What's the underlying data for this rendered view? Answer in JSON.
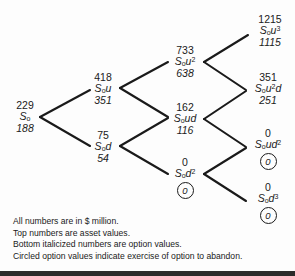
{
  "diagram": {
    "line_color": "#1a1a1a",
    "text_color": "#1a1a1a",
    "nodes": [
      {
        "id": "root",
        "asset": "229",
        "label_base": "S",
        "label_sub": "o",
        "label_sup": "",
        "label_tail": "",
        "option": "188",
        "circled": false
      },
      {
        "id": "u",
        "asset": "418",
        "label_base": "S",
        "label_sub": "o",
        "label_sup": "",
        "label_tail": "u",
        "option": "351",
        "circled": false
      },
      {
        "id": "d",
        "asset": "75",
        "label_base": "S",
        "label_sub": "o",
        "label_sup": "",
        "label_tail": "d",
        "option": "54",
        "circled": false
      },
      {
        "id": "uu",
        "asset": "733",
        "label_base": "S",
        "label_sub": "o",
        "label_sup": "2",
        "label_tail": "u",
        "option": "638",
        "circled": false
      },
      {
        "id": "ud",
        "asset": "162",
        "label_base": "S",
        "label_sub": "o",
        "label_sup": "",
        "label_tail": "ud",
        "option": "116",
        "circled": false
      },
      {
        "id": "dd",
        "asset": "0",
        "label_base": "S",
        "label_sub": "o",
        "label_sup": "2",
        "label_tail": "d",
        "option": "0",
        "circled": true
      },
      {
        "id": "uuu",
        "asset": "1215",
        "label_base": "S",
        "label_sub": "o",
        "label_sup": "3",
        "label_tail": "u",
        "option": "1115",
        "circled": false
      },
      {
        "id": "uud",
        "asset": "351",
        "label_base": "S",
        "label_sub": "o",
        "label_sup": "2",
        "label_tail": "u",
        "label_tail2": "d",
        "option": "251",
        "circled": false
      },
      {
        "id": "udd",
        "asset": "0",
        "label_base": "S",
        "label_sub": "o",
        "label_sup": "2",
        "label_tail": "ud",
        "option": "0",
        "circled": true
      },
      {
        "id": "ddd",
        "asset": "0",
        "label_base": "S",
        "label_sub": "o",
        "label_sup": "3",
        "label_tail": "d",
        "option": "0",
        "circled": true
      }
    ]
  },
  "legend": {
    "line1": "All numbers are in $ million.",
    "line2": "Top numbers are asset values.",
    "line3": "Bottom italicized numbers are option values.",
    "line4": "Circled option values indicate exercise of option to abandon."
  }
}
